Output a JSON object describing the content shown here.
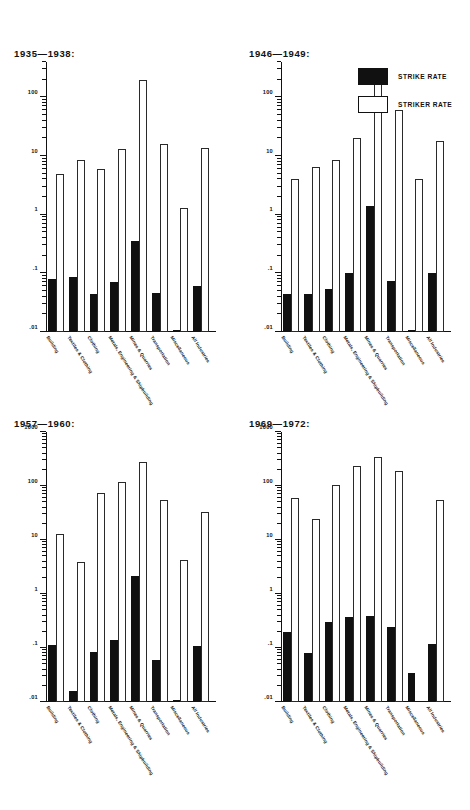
{
  "legend": {
    "position": "top-right",
    "entries": [
      {
        "key": "strike",
        "label": "STRIKE RATE",
        "color": "#111111",
        "style": "filled"
      },
      {
        "key": "striker",
        "label": "STRIKER RATE",
        "color": "#ffffff",
        "style": "outlined"
      }
    ]
  },
  "categories": [
    "Building",
    "Textiles & Clothing",
    "Clothing",
    "Metals, Engineering & Shipbuilding",
    "Mines & Quarries",
    "Transportation",
    "Miscellaneous",
    "All Industries"
  ],
  "chart_data": [
    {
      "type": "bar",
      "title": "1935—1938:",
      "xlabel": "",
      "ylabel": "",
      "yscale": "log",
      "ylim": [
        0.01,
        400
      ],
      "ytick_labels": [
        "100",
        "10",
        "1",
        ".1",
        ".01"
      ],
      "ytick_values": [
        100,
        10,
        1,
        0.1,
        0.01
      ],
      "grid": false,
      "categories": [
        "Building",
        "Textiles & Clothing",
        "Clothing",
        "Metals, Engineering & Shipbuilding",
        "Mines & Quarries",
        "Transportation",
        "Miscellaneous",
        "All Industries"
      ],
      "series": [
        {
          "name": "STRIKE RATE",
          "values": [
            0.08,
            0.085,
            0.045,
            0.07,
            0.35,
            0.047,
            0.011,
            0.06
          ]
        },
        {
          "name": "STRIKER RATE",
          "values": [
            5.0,
            8.5,
            6.0,
            13.0,
            200.0,
            16.0,
            1.3,
            13.5
          ]
        }
      ]
    },
    {
      "type": "bar",
      "title": "1946—1949:",
      "xlabel": "",
      "ylabel": "",
      "yscale": "log",
      "ylim": [
        0.01,
        400
      ],
      "ytick_labels": [
        "100",
        "10",
        "1",
        ".1",
        ".01"
      ],
      "ytick_values": [
        100,
        10,
        1,
        0.1,
        0.01
      ],
      "grid": false,
      "categories": [
        "Building",
        "Textiles & Clothing",
        "Clothing",
        "Metals, Engineering & Shipbuilding",
        "Mines & Quarries",
        "Transportation",
        "Miscellaneous",
        "All Industries"
      ],
      "series": [
        {
          "name": "STRIKE RATE",
          "values": [
            0.045,
            0.044,
            0.055,
            0.1,
            1.4,
            0.075,
            0.011,
            0.1
          ]
        },
        {
          "name": "STRIKER RATE",
          "values": [
            4.0,
            6.5,
            8.5,
            20.0,
            220.0,
            60.0,
            4.0,
            18.0
          ]
        }
      ]
    },
    {
      "type": "bar",
      "title": "1957—1960:",
      "xlabel": "",
      "ylabel": "",
      "yscale": "log",
      "ylim": [
        0.01,
        1000
      ],
      "ytick_labels": [
        "1000",
        "100",
        "10",
        "1",
        ".1",
        ".01"
      ],
      "ytick_values": [
        1000,
        100,
        10,
        1,
        0.1,
        0.01
      ],
      "grid": false,
      "categories": [
        "Building",
        "Textiles & Clothing",
        "Clothing",
        "Metals, Engineering & Shipbuilding",
        "Mines & Quarries",
        "Transportation",
        "Miscellaneous",
        "All Industries"
      ],
      "series": [
        {
          "name": "STRIKE RATE",
          "values": [
            0.115,
            0.016,
            0.085,
            0.14,
            2.2,
            0.06,
            0.011,
            0.11
          ]
        },
        {
          "name": "STRIKER RATE",
          "values": [
            13.0,
            4.0,
            75.0,
            120.0,
            280.0,
            55.0,
            4.3,
            33.0
          ]
        }
      ]
    },
    {
      "type": "bar",
      "title": "1969—1972:",
      "xlabel": "",
      "ylabel": "",
      "yscale": "log",
      "ylim": [
        0.01,
        1000
      ],
      "ytick_labels": [
        "1000",
        "100",
        "10",
        "1",
        ".1",
        ".01"
      ],
      "ytick_values": [
        1000,
        100,
        10,
        1,
        0.1,
        0.01
      ],
      "grid": false,
      "categories": [
        "Building",
        "Textiles & Clothing",
        "Clothing",
        "Metals, Engineering & Shipbuilding",
        "Mines & Quarries",
        "Transportation",
        "Miscellaneous",
        "All Industries"
      ],
      "series": [
        {
          "name": "STRIKE RATE",
          "values": [
            0.2,
            0.08,
            0.3,
            0.37,
            0.4,
            0.25,
            0.035,
            0.12
          ]
        },
        {
          "name": "STRIKER RATE",
          "values": [
            60.0,
            25.0,
            105.0,
            230.0,
            350.0,
            190.0,
            0.0,
            55.0
          ]
        }
      ]
    }
  ]
}
